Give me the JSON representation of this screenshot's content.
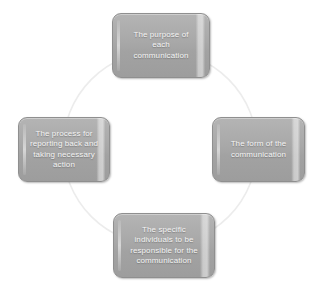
{
  "diagram": {
    "type": "cycle",
    "shape": "circle",
    "connector_color": "#ececec",
    "node_fill_color": "#a8a8a8",
    "node_border_color": "#8f8f8f",
    "node_text_color": "#f4f4f4",
    "background_color": "#ffffff",
    "nodes": [
      {
        "id": "purpose",
        "position": "top",
        "label": "The purpose of\neach\ncommunication"
      },
      {
        "id": "process",
        "position": "left",
        "label": "The process for\nreporting back and\ntaking necessary\naction"
      },
      {
        "id": "form",
        "position": "right",
        "label": "The form of the\ncommunication"
      },
      {
        "id": "individuals",
        "position": "bottom",
        "label": "The specific\nindividuals to be\nresponsible for the\ncommunication"
      }
    ]
  }
}
